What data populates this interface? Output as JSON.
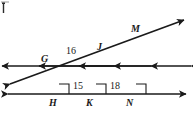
{
  "figure": {
    "type": "geometry-diagram",
    "stroke_color": "#1a1a1a",
    "background_color": "#ffffff",
    "point_labels": [
      {
        "name": "G",
        "text": "G",
        "x": 41,
        "y": 54
      },
      {
        "name": "J",
        "text": "J",
        "x": 97,
        "y": 42
      },
      {
        "name": "M",
        "text": "M",
        "x": 131,
        "y": 24
      },
      {
        "name": "H",
        "text": "H",
        "x": 49,
        "y": 98
      },
      {
        "name": "K",
        "text": "K",
        "x": 86,
        "y": 98
      },
      {
        "name": "N",
        "text": "N",
        "x": 126,
        "y": 98
      }
    ],
    "length_labels": [
      {
        "name": "GJ",
        "text": "16",
        "x": 66,
        "y": 46
      },
      {
        "name": "HK",
        "text": "15",
        "x": 75,
        "y": 81
      },
      {
        "name": "KN",
        "text": "18",
        "x": 110,
        "y": 81
      }
    ],
    "vertical_lines": [
      {
        "name": "line-through-G-H",
        "x": 58,
        "y_top": 10,
        "y_bottom": 122
      },
      {
        "name": "line-through-J-K",
        "x": 95,
        "y_top": 10,
        "y_bottom": 122
      },
      {
        "name": "line-through-M-N",
        "x": 135,
        "y_top": 10,
        "y_bottom": 122
      }
    ],
    "horizontal_line": {
      "name": "line-H-K-N",
      "y": 94,
      "x_left": 8,
      "x_right": 186
    },
    "transversal": {
      "name": "transversal-G-J-M",
      "x1": 10,
      "y1": 84,
      "x2": 184,
      "y2": 20
    },
    "right_angle_marks": [
      {
        "name": "right-angle-at-H",
        "x": 59,
        "y": 84
      },
      {
        "name": "right-angle-at-K",
        "x": 96,
        "y": 84
      },
      {
        "name": "right-angle-at-N",
        "x": 136,
        "y": 84
      }
    ]
  }
}
